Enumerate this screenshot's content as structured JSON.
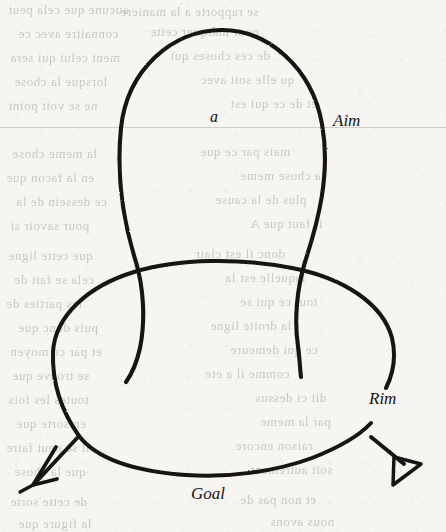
{
  "page": {
    "kind": "scanned-book-figure",
    "width": 446,
    "height": 532,
    "paper_color": "#f6f5f2",
    "ink_color": "#15130f"
  },
  "figure": {
    "title": "",
    "labels": {
      "node_a": "a",
      "aim": "Aim",
      "rim": "Rim",
      "goal": "Goal"
    },
    "shapes": {
      "aim_loop": "tall vertical loop crossing down into the rim oval",
      "rim_oval": "horizontal oval with a break at the right where the Rim label sits",
      "left_arrow": "barbed open V arrowhead pointing down-left",
      "right_arrow": "hollow outlined triangle arrowhead pointing down-right"
    }
  },
  "ghost_text": {
    "lines": [
      {
        "text": "aucune que cela peut",
        "x": 8,
        "y": 2,
        "size": 13
      },
      {
        "text": "se rapporte a la maniere",
        "x": 120,
        "y": 4,
        "size": 13
      },
      {
        "text": "connaitre avec ce",
        "x": 18,
        "y": 26,
        "size": 13
      },
      {
        "text": "pour marquer cette",
        "x": 150,
        "y": 24,
        "size": 13
      },
      {
        "text": "ment celui qui sera",
        "x": 10,
        "y": 50,
        "size": 13
      },
      {
        "text": "de ces choses qui",
        "x": 170,
        "y": 48,
        "size": 13
      },
      {
        "text": "lorsque la chose",
        "x": 14,
        "y": 74,
        "size": 13
      },
      {
        "text": "qu elle soit avec",
        "x": 200,
        "y": 72,
        "size": 13
      },
      {
        "text": "ne se voit point",
        "x": 8,
        "y": 98,
        "size": 13
      },
      {
        "text": "et de ce qui est",
        "x": 230,
        "y": 96,
        "size": 13
      },
      {
        "text": "la meme chose",
        "x": 12,
        "y": 146,
        "size": 13
      },
      {
        "text": "mais par ce que",
        "x": 200,
        "y": 144,
        "size": 13
      },
      {
        "text": "en la facon que",
        "x": 6,
        "y": 170,
        "size": 13
      },
      {
        "text": "la chose meme",
        "x": 240,
        "y": 168,
        "size": 13
      },
      {
        "text": "ce dessein de la",
        "x": 16,
        "y": 194,
        "size": 13
      },
      {
        "text": "plus de la cause",
        "x": 215,
        "y": 192,
        "size": 13
      },
      {
        "text": "pour savoir si",
        "x": 10,
        "y": 218,
        "size": 13
      },
      {
        "text": "il faut que A",
        "x": 250,
        "y": 216,
        "size": 13
      },
      {
        "text": "que cette ligne",
        "x": 8,
        "y": 248,
        "size": 13
      },
      {
        "text": "donc il est clair",
        "x": 195,
        "y": 246,
        "size": 13
      },
      {
        "text": "cela se fait de",
        "x": 14,
        "y": 272,
        "size": 13
      },
      {
        "text": "laquelle est la",
        "x": 225,
        "y": 270,
        "size": 13
      },
      {
        "text": "les parties de",
        "x": 6,
        "y": 296,
        "size": 13
      },
      {
        "text": "tout ce qui se",
        "x": 240,
        "y": 294,
        "size": 13
      },
      {
        "text": "puis donc que",
        "x": 18,
        "y": 320,
        "size": 13
      },
      {
        "text": "la droite ligne",
        "x": 210,
        "y": 318,
        "size": 13
      },
      {
        "text": "et par ce moyen",
        "x": 10,
        "y": 344,
        "size": 13
      },
      {
        "text": "ce qui demeure",
        "x": 230,
        "y": 342,
        "size": 13
      },
      {
        "text": "se trouve que",
        "x": 12,
        "y": 368,
        "size": 13
      },
      {
        "text": "comme il a ete",
        "x": 205,
        "y": 366,
        "size": 13
      },
      {
        "text": "toutes les fois",
        "x": 8,
        "y": 392,
        "size": 13
      },
      {
        "text": "dit ci dessus",
        "x": 255,
        "y": 390,
        "size": 13
      },
      {
        "text": "en sorte que",
        "x": 16,
        "y": 416,
        "size": 13
      },
      {
        "text": "par la meme",
        "x": 260,
        "y": 414,
        "size": 13
      },
      {
        "text": "il se peut faire",
        "x": 6,
        "y": 440,
        "size": 13
      },
      {
        "text": "raison encore",
        "x": 235,
        "y": 438,
        "size": 13
      },
      {
        "text": "que la chose",
        "x": 14,
        "y": 464,
        "size": 13
      },
      {
        "text": "soit autrement",
        "x": 250,
        "y": 462,
        "size": 13
      },
      {
        "text": "de cette sorte",
        "x": 10,
        "y": 494,
        "size": 13
      },
      {
        "text": "et non pas de",
        "x": 240,
        "y": 492,
        "size": 13
      },
      {
        "text": "la figure que",
        "x": 18,
        "y": 516,
        "size": 13
      },
      {
        "text": "nous avons",
        "x": 270,
        "y": 514,
        "size": 13
      }
    ]
  },
  "chart_data": {
    "type": "diagram",
    "title": "",
    "nodes": [
      {
        "id": "a",
        "label": "a",
        "x": 215,
        "y": 115,
        "kind": "point-label"
      },
      {
        "id": "aim",
        "label": "Aim",
        "x": 340,
        "y": 120,
        "kind": "curve-label"
      },
      {
        "id": "rim",
        "label": "Rim",
        "x": 380,
        "y": 398,
        "kind": "curve-label"
      },
      {
        "id": "goal",
        "label": "Goal",
        "x": 215,
        "y": 493,
        "kind": "curve-label"
      }
    ],
    "edges": [
      {
        "from": "rim",
        "to": "goal-left",
        "style": "barbed-arrow"
      },
      {
        "from": "rim",
        "to": "goal-right",
        "style": "open-triangle-arrow"
      }
    ]
  }
}
